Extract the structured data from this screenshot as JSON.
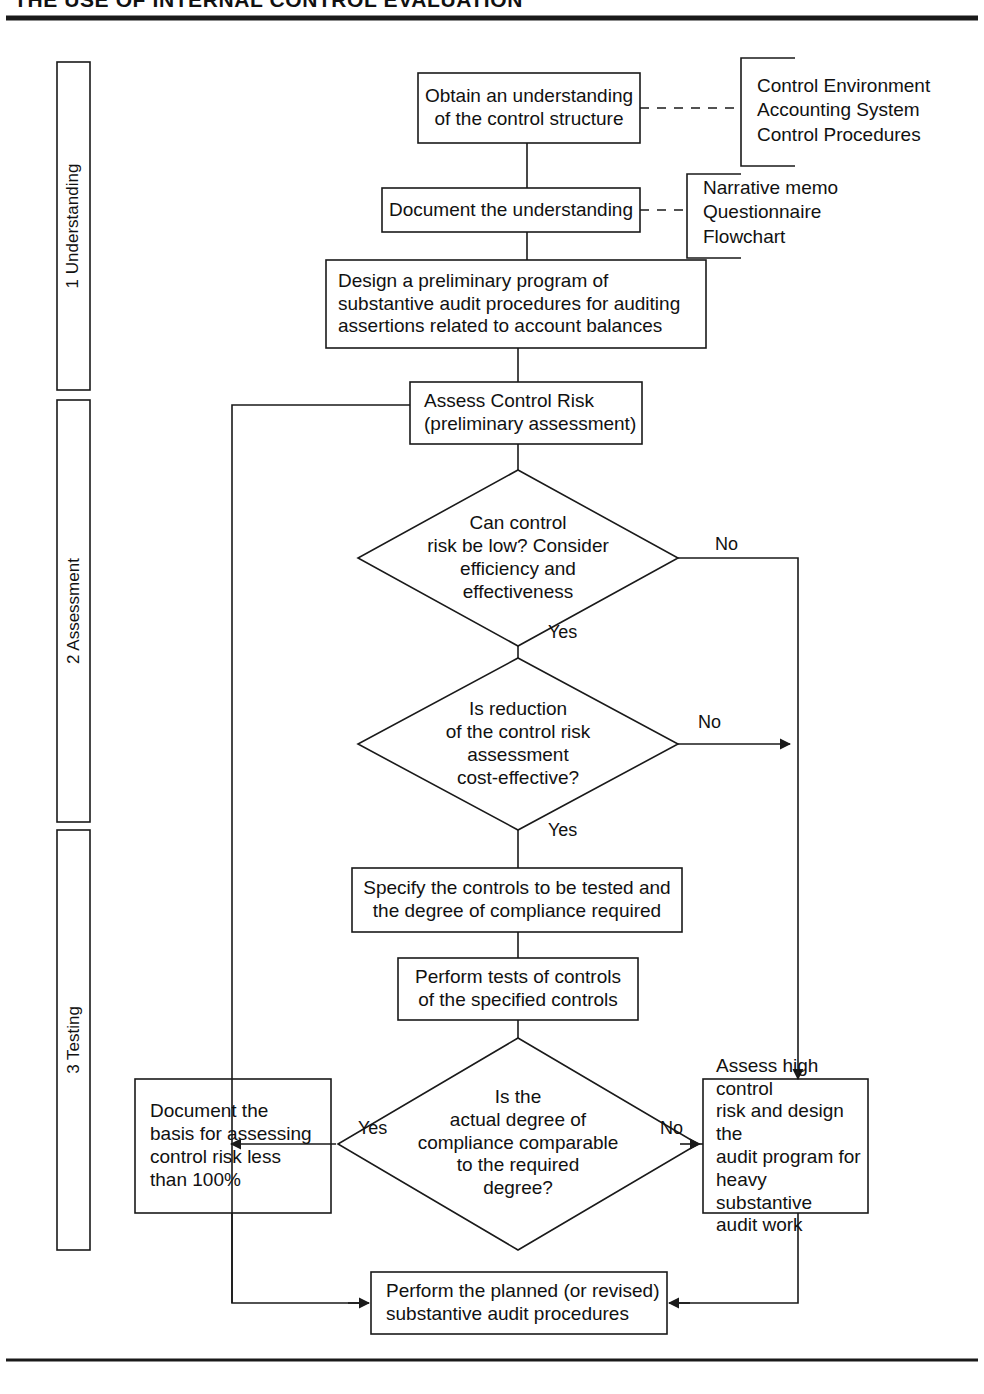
{
  "title": "THE USE OF INTERNAL CONTROL EVALUATION",
  "colors": {
    "ink": "#111111",
    "line": "#1a1a1a",
    "paper": "#ffffff"
  },
  "phases": [
    {
      "id": "phase-1",
      "label": "1 Understanding"
    },
    {
      "id": "phase-2",
      "label": "2 Assessment"
    },
    {
      "id": "phase-3",
      "label": "3 Testing"
    }
  ],
  "nodes": {
    "obtain_understanding": "Obtain an understanding\nof the control structure",
    "document_understanding": "Document the understanding",
    "design_preliminary": "Design a preliminary program of\nsubstantive audit procedures for auditing\nassertions related to account balances",
    "assess_control_risk": "Assess Control Risk\n(preliminary assessment)",
    "can_risk_be_low": "Can control\nrisk be low? Consider\nefficiency and\neffectiveness",
    "is_reduction_cost_effective": "Is reduction\nof the control risk\nassessment\ncost-effective?",
    "specify_controls": "Specify the controls to be tested and\nthe degree of compliance required",
    "perform_tests": "Perform tests of controls\nof the specified controls",
    "is_actual_degree": "Is the\nactual degree of\ncompliance comparable\nto the required\ndegree?",
    "document_basis": "Document the\nbasis for assessing\ncontrol risk less\nthan 100%",
    "assess_high_risk": "Assess high control\nrisk and design the\naudit program for\nheavy substantive\naudit work",
    "perform_planned": "Perform the planned (or revised)\nsubstantive audit procedures"
  },
  "annotations": {
    "understanding_methods": "Control Environment\nAccounting System\nControl Procedures",
    "documentation_methods": "Narrative memo\nQuestionnaire\nFlowchart"
  },
  "edge_labels": {
    "low_risk_no": "No",
    "low_risk_yes": "Yes",
    "cost_effective_no": "No",
    "cost_effective_yes": "Yes",
    "degree_yes": "Yes",
    "degree_no": "No"
  }
}
